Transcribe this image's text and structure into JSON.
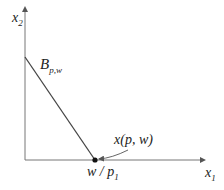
{
  "diagram": {
    "type": "budget-set",
    "axes": {
      "x_label": "x",
      "x_sub": "1",
      "y_label": "x",
      "y_sub": "2"
    },
    "budget_line_label": "B",
    "budget_line_sub": "p,w",
    "point_label": "x(p, w)",
    "intercept_label": "w / p",
    "intercept_sub": "1",
    "colors": {
      "line": "#4a4a4a",
      "point": "#111111",
      "text": "#222222"
    }
  }
}
